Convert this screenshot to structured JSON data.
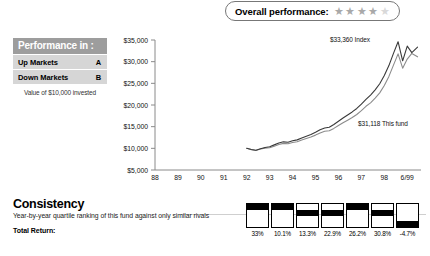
{
  "overall": {
    "label": "Overall performance:",
    "rating": 4,
    "max_stars": 5,
    "star_glyph": "★"
  },
  "performance_table": {
    "header": "Performance in :",
    "rows": [
      {
        "label": "Up Markets",
        "grade": "A"
      },
      {
        "label": "Down Markets",
        "grade": "B"
      }
    ],
    "note": "Value of $10,000 invested"
  },
  "annotations": {
    "index": "$33,360 Index",
    "fund": "$31,118 This fund"
  },
  "consistency": {
    "title": "Consistency",
    "subtitle": "Year-by-year quartile ranking of this fund against only similar rivals",
    "total_return_label": "Total Return:",
    "cells": [
      {
        "value": "33%",
        "quartile": 1
      },
      {
        "value": "10.1%",
        "quartile": 1
      },
      {
        "value": "13.3%",
        "quartile": 2
      },
      {
        "value": "22.9%",
        "quartile": 2
      },
      {
        "value": "26.2%",
        "quartile": 1
      },
      {
        "value": "30.8%",
        "quartile": 2
      },
      {
        "value": "-4.7%",
        "quartile": 4
      }
    ]
  },
  "chart_data": {
    "type": "line",
    "title": "",
    "xlabel": "",
    "ylabel": "",
    "ylim": [
      5000,
      35000
    ],
    "ytick_labels": [
      "$5,000",
      "$10,000",
      "$15,000",
      "$20,000",
      "$25,000",
      "$30,000",
      "$35,000"
    ],
    "ytick_values": [
      5000,
      10000,
      15000,
      20000,
      25000,
      30000,
      35000
    ],
    "xtick_labels": [
      "88",
      "89",
      "90",
      "91",
      "92",
      "93",
      "94",
      "95",
      "96",
      "97",
      "98",
      "6/99"
    ],
    "grid": false,
    "legend_position": "inline-annotation",
    "series": [
      {
        "name": "This fund",
        "color": "#8c8c8c",
        "end_label": "$31,118 This fund",
        "end_value": 31118,
        "x": [
          92.0,
          92.2,
          92.4,
          92.6,
          92.8,
          93.0,
          93.2,
          93.4,
          93.6,
          93.8,
          94.0,
          94.2,
          94.4,
          94.6,
          94.8,
          95.0,
          95.2,
          95.4,
          95.6,
          95.8,
          96.0,
          96.2,
          96.4,
          96.6,
          96.8,
          97.0,
          97.2,
          97.4,
          97.6,
          97.8,
          98.0,
          98.2,
          98.4,
          98.6,
          98.8,
          99.0,
          99.2,
          99.45
        ],
        "values": [
          10000,
          9700,
          9500,
          9850,
          10050,
          10150,
          10500,
          10900,
          11150,
          11050,
          11350,
          11500,
          11900,
          12250,
          12600,
          13050,
          13550,
          13950,
          14050,
          14600,
          15250,
          15900,
          16500,
          17100,
          17800,
          18700,
          19700,
          20500,
          21600,
          22800,
          24500,
          26600,
          29200,
          31800,
          28500,
          30600,
          31900,
          31118
        ]
      },
      {
        "name": "Index",
        "color": "#3a3a3a",
        "end_label": "$33,360 Index",
        "end_value": 33360,
        "x": [
          92.0,
          92.2,
          92.4,
          92.6,
          92.8,
          93.0,
          93.2,
          93.4,
          93.6,
          93.8,
          94.0,
          94.2,
          94.4,
          94.6,
          94.8,
          95.0,
          95.2,
          95.4,
          95.6,
          95.8,
          96.0,
          96.2,
          96.4,
          96.6,
          96.8,
          97.0,
          97.2,
          97.4,
          97.6,
          97.8,
          98.0,
          98.2,
          98.4,
          98.6,
          98.8,
          99.0,
          99.2,
          99.45
        ],
        "values": [
          10000,
          9750,
          9550,
          9900,
          10200,
          10350,
          10800,
          11250,
          11500,
          11400,
          11750,
          11950,
          12400,
          12800,
          13200,
          13700,
          14300,
          14700,
          14850,
          15500,
          16250,
          17000,
          17700,
          18400,
          19200,
          20200,
          21300,
          22300,
          23500,
          24900,
          26800,
          29100,
          31900,
          34600,
          30200,
          33600,
          32100,
          33360
        ]
      }
    ]
  }
}
